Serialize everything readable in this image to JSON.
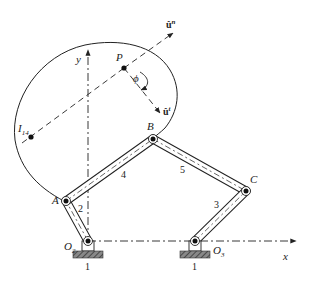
{
  "diagram": {
    "type": "four-bar linkage with coupler body",
    "axes": {
      "x_label": "x",
      "y_label": "y"
    },
    "points": {
      "P": {
        "label": "P"
      },
      "A": {
        "label": "A"
      },
      "B": {
        "label": "B"
      },
      "C": {
        "label": "C"
      },
      "O2": {
        "label": "O",
        "sub": "2"
      },
      "O3": {
        "label": "O",
        "sub": "3"
      },
      "I14": {
        "label": "I",
        "sub": "14"
      }
    },
    "links": {
      "ground_left": "1",
      "ground_right": "1",
      "link2": "2",
      "link3": "3",
      "link4": "4",
      "link5": "5"
    },
    "vectors": {
      "normal": {
        "label": "û",
        "sup": "n"
      },
      "tangent": {
        "label": "û",
        "sup": "t"
      }
    },
    "angle": {
      "label": "ϕ"
    },
    "colors": {
      "stroke": "#222222",
      "hatch": "#555555",
      "background": "#ffffff"
    }
  }
}
